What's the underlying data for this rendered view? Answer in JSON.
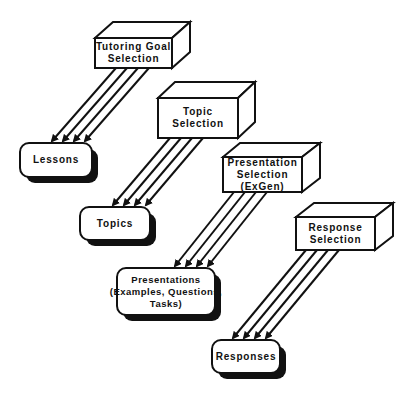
{
  "diagram": {
    "colors": {
      "stroke": "#111111",
      "background": "#ffffff",
      "shadow": "#111111"
    },
    "selectors": [
      {
        "id": "tutoring-goal-selection",
        "lines": [
          "Tutoring  Goal",
          "Selection"
        ]
      },
      {
        "id": "topic-selection",
        "lines": [
          "Topic",
          "Selection"
        ]
      },
      {
        "id": "presentation-selection",
        "lines": [
          "Presentation",
          "Selection",
          "(ExGen)"
        ]
      },
      {
        "id": "response-selection",
        "lines": [
          "Response",
          "Selection"
        ]
      }
    ],
    "outputs": [
      {
        "id": "lessons",
        "lines": [
          "Lessons"
        ]
      },
      {
        "id": "topics",
        "lines": [
          "Topics"
        ]
      },
      {
        "id": "presentations",
        "lines": [
          "Presentations",
          "(Examples,  Questions,",
          "Tasks)"
        ]
      },
      {
        "id": "responses",
        "lines": [
          "Responses"
        ]
      }
    ],
    "connections": [
      {
        "from": "tutoring-goal-selection",
        "to": "lessons",
        "arrow_count": 4
      },
      {
        "from": "topic-selection",
        "to": "topics",
        "arrow_count": 4
      },
      {
        "from": "presentation-selection",
        "to": "presentations",
        "arrow_count": 4
      },
      {
        "from": "response-selection",
        "to": "responses",
        "arrow_count": 4
      }
    ]
  }
}
